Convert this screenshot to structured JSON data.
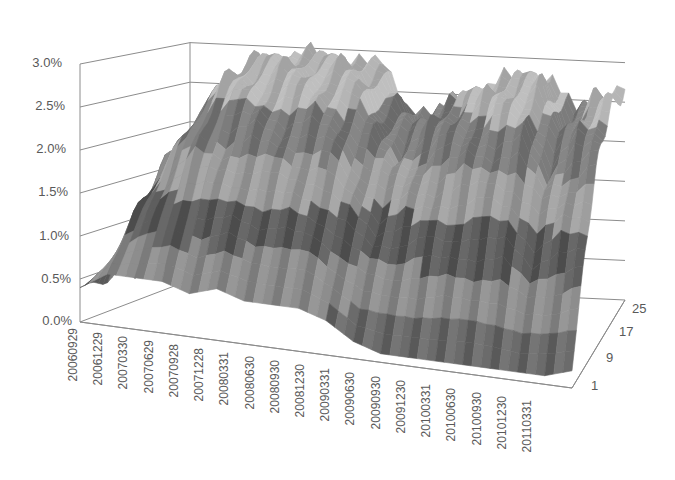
{
  "chart_data": {
    "type": "surface-3d",
    "title": "",
    "xlabel": "",
    "ylabel": "",
    "zlabel": "",
    "y_axis": {
      "ticks": [
        "0.0%",
        "0.5%",
        "1.0%",
        "1.5%",
        "2.0%",
        "2.5%",
        "3.0%"
      ],
      "range": [
        0,
        0.03
      ]
    },
    "x_axis": {
      "ticks": [
        "20060929",
        "20061229",
        "20070330",
        "20070629",
        "20070928",
        "20071228",
        "20080331",
        "20080630",
        "20080930",
        "20081230",
        "20090331",
        "20090630",
        "20090930",
        "20091230",
        "20100331",
        "20100630",
        "20100930",
        "20101230",
        "20110331"
      ]
    },
    "depth_axis": {
      "ticks": [
        "1",
        "9",
        "17",
        "25"
      ]
    },
    "grid": true,
    "legend": "none",
    "color_bands": [
      "#5a5a5a",
      "#7a7a7a",
      "#9a9a9a",
      "#b8b8b8",
      "#d0d0d0",
      "#8a8a8a"
    ],
    "surface_profile_note": "Approximate max value (front-to-back ridge) per x tick",
    "ridge_values": [
      0.004,
      0.018,
      0.024,
      0.028,
      0.029,
      0.029,
      0.029,
      0.029,
      0.028,
      0.024,
      0.022,
      0.024,
      0.026,
      0.027,
      0.028,
      0.028,
      0.023,
      0.026,
      0.027
    ],
    "front_edge_values": [
      0.004,
      0.006,
      0.006,
      0.006,
      0.005,
      0.006,
      0.005,
      0.005,
      0.005,
      0.004,
      0.002,
      0.001,
      0.001,
      0.001,
      0.001,
      0.001,
      0.001,
      0.001,
      0.002
    ]
  },
  "labels": {
    "y": [
      "3.0%",
      "2.5%",
      "2.0%",
      "1.5%",
      "1.0%",
      "0.5%",
      "0.0%"
    ],
    "x": [
      "20060929",
      "20061229",
      "20070330",
      "20070629",
      "20070928",
      "20071228",
      "20080331",
      "20080630",
      "20080930",
      "20081230",
      "20090331",
      "20090630",
      "20090930",
      "20091230",
      "20100331",
      "20100630",
      "20100930",
      "20101230",
      "20110331"
    ],
    "z": [
      "25",
      "17",
      "9",
      "1"
    ]
  }
}
